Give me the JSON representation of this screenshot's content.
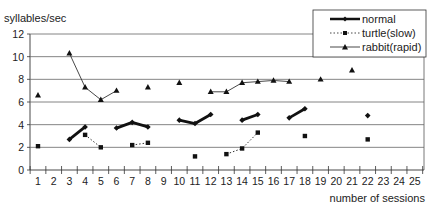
{
  "chart_data": {
    "type": "line",
    "title": "",
    "ylabel": "syllables/sec",
    "xlabel": "number of sessions",
    "ylim": [
      0,
      12
    ],
    "yticks": [
      0,
      2,
      4,
      6,
      8,
      10,
      12
    ],
    "xlim": [
      0.5,
      25.5
    ],
    "xticks": [
      1,
      2,
      3,
      4,
      5,
      6,
      7,
      8,
      9,
      10,
      11,
      12,
      13,
      14,
      15,
      16,
      17,
      18,
      19,
      20,
      21,
      22,
      23,
      24,
      25
    ],
    "grid": true,
    "legend_position": "top-right",
    "series": [
      {
        "name": "normal",
        "style": "thick-solid",
        "marker": "diamond",
        "segments": [
          [
            [
              3,
              2.7
            ],
            [
              4,
              3.8
            ]
          ],
          [
            [
              6,
              3.7
            ],
            [
              7,
              4.2
            ],
            [
              8,
              3.8
            ]
          ],
          [
            [
              10,
              4.4
            ],
            [
              11,
              4.1
            ],
            [
              12,
              4.9
            ]
          ],
          [
            [
              14,
              4.4
            ],
            [
              15,
              4.9
            ]
          ],
          [
            [
              17,
              4.6
            ],
            [
              18,
              5.4
            ]
          ],
          [
            [
              22,
              4.8
            ]
          ]
        ]
      },
      {
        "name": "turtle(slow)",
        "style": "dotted",
        "marker": "square",
        "segments": [
          [
            [
              1,
              2.1
            ]
          ],
          [
            [
              4,
              3.1
            ],
            [
              5,
              2.0
            ]
          ],
          [
            [
              7,
              2.2
            ],
            [
              8,
              2.4
            ]
          ],
          [
            [
              11,
              1.2
            ]
          ],
          [
            [
              13,
              1.4
            ],
            [
              14,
              1.9
            ],
            [
              15,
              3.3
            ]
          ],
          [
            [
              18,
              3.0
            ]
          ],
          [
            [
              22,
              2.7
            ]
          ]
        ]
      },
      {
        "name": "rabbit(rapid)",
        "style": "thin-solid",
        "marker": "triangle",
        "segments": [
          [
            [
              1,
              6.6
            ]
          ],
          [
            [
              3,
              10.3
            ],
            [
              4,
              7.3
            ],
            [
              5,
              6.2
            ],
            [
              6,
              7.0
            ]
          ],
          [
            [
              8,
              7.3
            ]
          ],
          [
            [
              10,
              7.7
            ]
          ],
          [
            [
              12,
              6.9
            ],
            [
              13,
              6.9
            ],
            [
              14,
              7.7
            ],
            [
              15,
              7.8
            ],
            [
              16,
              7.9
            ],
            [
              17,
              7.8
            ]
          ],
          [
            [
              19,
              8.0
            ]
          ],
          [
            [
              21,
              8.8
            ]
          ]
        ]
      }
    ]
  },
  "legend": {
    "items": [
      "normal",
      "turtle(slow)",
      "rabbit(rapid)"
    ]
  }
}
